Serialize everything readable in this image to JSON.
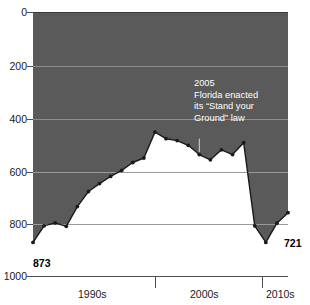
{
  "chart_data": {
    "type": "line",
    "title": "Gun deaths in Florida by year",
    "xlabel": "",
    "ylabel": "",
    "ylim": [
      0,
      1000
    ],
    "y_inverted": true,
    "grid": true,
    "legend": "none",
    "y_ticks": [
      0,
      200,
      400,
      600,
      800,
      1000
    ],
    "y_tick_labels": [
      "0",
      "200",
      "400",
      "600",
      "800",
      "1000"
    ],
    "x_tick_labels": [
      "1990s",
      "2000s",
      "2010s"
    ],
    "x": [
      1990,
      1991,
      1992,
      1993,
      1994,
      1995,
      1996,
      1997,
      1998,
      1999,
      2000,
      2001,
      2002,
      2003,
      2004,
      2005,
      2006,
      2007,
      2008,
      2009,
      2010,
      2011,
      2012,
      2013
    ],
    "values": [
      873,
      810,
      799,
      812,
      737,
      680,
      650,
      623,
      600,
      570,
      553,
      455,
      480,
      487,
      505,
      540,
      560,
      522,
      540,
      495,
      810,
      873,
      800,
      760
    ],
    "series": [
      {
        "name": "Gun deaths in Florida",
        "values": [
          873,
          810,
          799,
          812,
          737,
          680,
          650,
          623,
          600,
          570,
          553,
          455,
          480,
          487,
          505,
          540,
          560,
          522,
          540,
          495,
          810,
          873,
          800,
          760
        ]
      }
    ],
    "annotations": [
      {
        "name": "stand-your-ground-note",
        "lines": [
          "2005",
          "Florida enacted",
          "its “Stand your",
          "Ground” law"
        ],
        "points_to_year": 2005
      }
    ],
    "point_labels": [
      {
        "name": "start-value",
        "text": "873",
        "position": "bottom-left"
      },
      {
        "name": "end-value",
        "text": "721",
        "position": "right"
      }
    ],
    "colors": {
      "fill_above": "#5a5a5a",
      "fill_below": "#ffffff",
      "line": "#1a1a1a",
      "marker": "#1a1a1a",
      "gridline": "#7d7d7d",
      "axis": "#4d4d4d",
      "annotation_text": "#ffffff",
      "tick_text": "#1a1a1a"
    }
  },
  "y_axis": {
    "ticks": [
      {
        "label": "0"
      },
      {
        "label": "200"
      },
      {
        "label": "400"
      },
      {
        "label": "600"
      },
      {
        "label": "800"
      },
      {
        "label": "1000"
      }
    ]
  },
  "x_axis": {
    "ticks": [
      {
        "label": "1990s"
      },
      {
        "label": "2000s"
      },
      {
        "label": "2010s"
      }
    ]
  },
  "annotation": {
    "line1": "2005",
    "line2": "Florida enacted",
    "line3": "its “Stand your",
    "line4": "Ground” law"
  },
  "labels": {
    "start_value": "873",
    "end_value": "721"
  },
  "title": "Gun deaths in Florida by year"
}
